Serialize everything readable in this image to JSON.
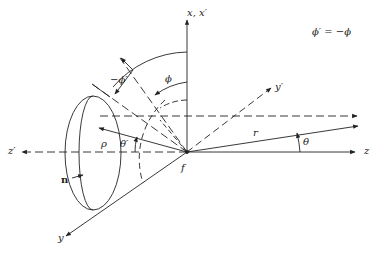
{
  "diagram": {
    "labels": {
      "x_axis": "x, x′",
      "y_prime": "y′",
      "z_axis": "z",
      "z_prime": "z′",
      "y_axis": "y",
      "phi": "ϕ",
      "neg_phi_prime": "−ϕ′",
      "rho": "ρ",
      "theta_prime": "θ′",
      "theta": "θ",
      "r": "r",
      "f": "f",
      "n": "n",
      "relation": "ϕ′ = −ϕ"
    },
    "colors": {
      "line": "#222222",
      "background": "#ffffff"
    }
  }
}
